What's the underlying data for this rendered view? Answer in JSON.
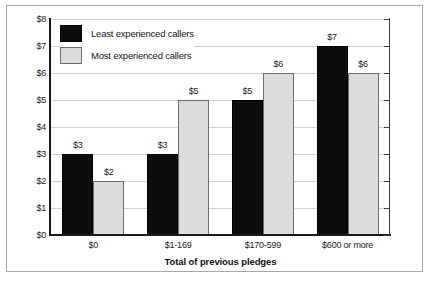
{
  "chart_data": {
    "type": "bar",
    "title": "",
    "xlabel": "Total of previous pledges",
    "ylabel": "",
    "categories": [
      "$0",
      "$1-169",
      "$170-599",
      "$600 or more"
    ],
    "series": [
      {
        "name": "Least experienced callers",
        "color": "#0d0d0d",
        "values": [
          3,
          3,
          5,
          7
        ],
        "value_labels": [
          "$3",
          "$3",
          "$5",
          "$7"
        ]
      },
      {
        "name": "Most experienced callers",
        "color": "#dcdcdc",
        "values": [
          2,
          5,
          6,
          6
        ],
        "value_labels": [
          "$2",
          "$5",
          "$6",
          "$6"
        ]
      }
    ],
    "ylim": [
      0,
      8
    ],
    "ytick_values": [
      0,
      1,
      2,
      3,
      4,
      5,
      6,
      7,
      8
    ],
    "ytick_labels": [
      "$0",
      "$1",
      "$2",
      "$3",
      "$4",
      "$5",
      "$6",
      "$7",
      "$8"
    ],
    "grid": true,
    "grid_axis": "y",
    "legend_position": "top-left-inside"
  },
  "legend": {
    "entries": [
      {
        "label": "Least experienced callers",
        "swatch": "black-square-icon"
      },
      {
        "label": "Most experienced callers",
        "swatch": "gray-square-icon"
      }
    ]
  },
  "axes": {
    "x_title": "Total of previous pledges"
  }
}
